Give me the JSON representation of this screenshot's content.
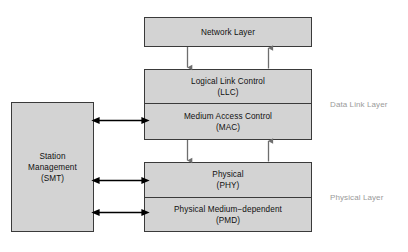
{
  "diagram": {
    "background_color": "#ffffff",
    "box_fill_color": "#d3d3d3",
    "box_border_color": "#3a3a3a",
    "side_label_color": "#9a9a9a",
    "arrow_color": "#000000",
    "flow_arrow_color": "#707070"
  },
  "boxes": {
    "network": {
      "name": "Network Layer",
      "line1": "Network Layer"
    },
    "llc": {
      "line1": "Logical Link Control",
      "line2": "(LLC)"
    },
    "mac": {
      "line1": "Medium Access Control",
      "line2": "(MAC)"
    },
    "phy": {
      "line1": "Physical",
      "line2": "(PHY)"
    },
    "pmd": {
      "line1": "Physical Medium−dependent",
      "line2": "(PMD)"
    },
    "smt": {
      "line1": "Station",
      "line2": "Management",
      "line3": "(SMT)"
    }
  },
  "side_labels": {
    "data_link": "Data Link Layer",
    "physical": "Physical Layer"
  },
  "connectors": [
    {
      "id": "network-to-llc",
      "kind": "arrow-down",
      "from": "Network Layer",
      "to": "Logical Link Control (LLC)"
    },
    {
      "id": "llc-to-network",
      "kind": "arrow-up",
      "from": "Logical Link Control (LLC)",
      "to": "Network Layer"
    },
    {
      "id": "mac-to-phy",
      "kind": "arrow-down",
      "from": "Medium Access Control (MAC)",
      "to": "Physical (PHY)"
    },
    {
      "id": "phy-to-mac",
      "kind": "arrow-up",
      "from": "Physical (PHY)",
      "to": "Medium Access Control (MAC)"
    },
    {
      "id": "smt-to-mac",
      "kind": "arrow-double",
      "from": "Station Management (SMT)",
      "to": "Medium Access Control (MAC)"
    },
    {
      "id": "smt-to-phy",
      "kind": "arrow-double",
      "from": "Station Management (SMT)",
      "to": "Physical (PHY)"
    },
    {
      "id": "smt-to-pmd",
      "kind": "arrow-double",
      "from": "Station Management (SMT)",
      "to": "Physical Medium−dependent (PMD)"
    }
  ]
}
